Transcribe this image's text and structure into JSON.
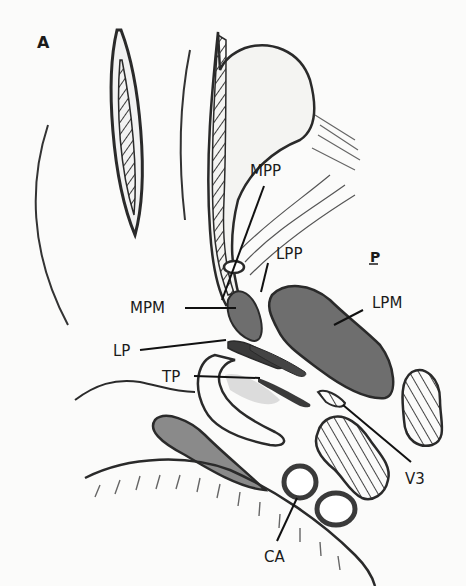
{
  "figure": {
    "panel_label": "A",
    "orientation_marker": "P",
    "labels": {
      "mpp": "MPP",
      "lpp": "LPP",
      "lpm": "LPM",
      "mpm": "MPM",
      "lp": "LP",
      "tp": "TP",
      "v3": "V3",
      "ca": "CA"
    }
  },
  "colors": {
    "ink": "#2a2a2a",
    "muscle_fill": "#6e6e6e",
    "paper": "#fbfbfa"
  }
}
